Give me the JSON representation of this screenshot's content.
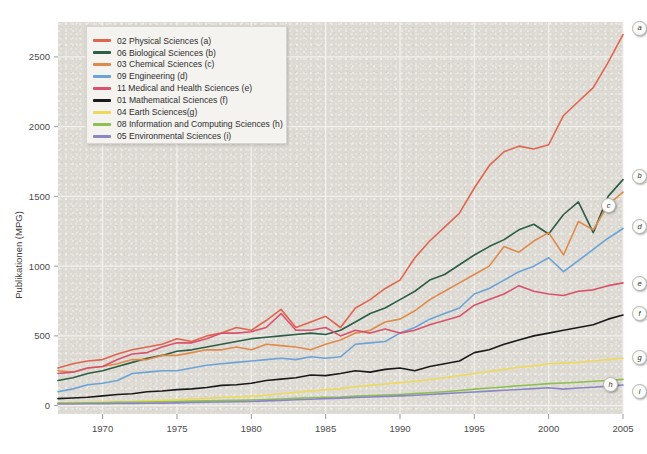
{
  "chart_data": {
    "type": "line",
    "title": "",
    "xlabel": "",
    "ylabel": "Publikationen (MPG)",
    "xlim": [
      1967,
      2005
    ],
    "ylim": [
      -60,
      2750
    ],
    "grid": true,
    "legend_position": "top-left",
    "xticks": [
      "1970",
      "1975",
      "1980",
      "1985",
      "1990",
      "1995",
      "2000",
      "2005"
    ],
    "xtick_values": [
      1970,
      1975,
      1980,
      1985,
      1990,
      1995,
      2000,
      2005
    ],
    "yticks": [
      "0",
      "500",
      "1000",
      "1500",
      "2000",
      "2500"
    ],
    "ytick_values": [
      0,
      500,
      1000,
      1500,
      2000,
      2500
    ],
    "x": [
      1967,
      1968,
      1969,
      1970,
      1971,
      1972,
      1973,
      1974,
      1975,
      1976,
      1977,
      1978,
      1979,
      1980,
      1981,
      1982,
      1983,
      1984,
      1985,
      1986,
      1987,
      1988,
      1989,
      1990,
      1991,
      1992,
      1993,
      1994,
      1995,
      1996,
      1997,
      1998,
      1999,
      2000,
      2001,
      2002,
      2003,
      2004,
      2005
    ],
    "series": [
      {
        "name": "02 Physical Sciences (a)",
        "code": "02",
        "endpoint_label": "a",
        "color": "#e0654f",
        "values": [
          270,
          300,
          320,
          330,
          370,
          400,
          420,
          440,
          480,
          460,
          500,
          520,
          560,
          540,
          610,
          690,
          560,
          600,
          640,
          560,
          700,
          760,
          840,
          900,
          1060,
          1180,
          1280,
          1380,
          1560,
          1720,
          1820,
          1860,
          1840,
          1870,
          2080,
          2180,
          2280,
          2460,
          2660
        ]
      },
      {
        "name": "06 Biological Sciences (b)",
        "code": "06",
        "endpoint_label": "b",
        "color": "#2c5d45",
        "values": [
          180,
          200,
          230,
          250,
          280,
          310,
          340,
          360,
          390,
          400,
          420,
          440,
          460,
          480,
          490,
          500,
          510,
          520,
          510,
          540,
          600,
          660,
          700,
          760,
          820,
          900,
          940,
          1010,
          1080,
          1140,
          1190,
          1260,
          1300,
          1230,
          1370,
          1460,
          1240,
          1500,
          1620
        ]
      },
      {
        "name": "03 Chemical Sciences (c)",
        "code": "03",
        "endpoint_label": "c",
        "color": "#e08a4a",
        "values": [
          250,
          240,
          270,
          280,
          300,
          330,
          330,
          360,
          360,
          380,
          400,
          400,
          420,
          400,
          440,
          430,
          420,
          400,
          440,
          470,
          520,
          540,
          600,
          620,
          680,
          760,
          820,
          880,
          940,
          1000,
          1140,
          1100,
          1180,
          1240,
          1080,
          1320,
          1260,
          1440,
          1530
        ]
      },
      {
        "name": "09 Engineering (d)",
        "code": "09",
        "endpoint_label": "d",
        "color": "#6ba3d6",
        "values": [
          100,
          120,
          150,
          160,
          180,
          230,
          240,
          250,
          250,
          270,
          290,
          300,
          310,
          320,
          330,
          340,
          330,
          350,
          340,
          350,
          440,
          450,
          460,
          520,
          560,
          620,
          660,
          700,
          800,
          840,
          900,
          960,
          1000,
          1060,
          960,
          1040,
          1120,
          1200,
          1270
        ]
      },
      {
        "name": "11 Medical and Health Sciences (e)",
        "code": "11",
        "endpoint_label": "e",
        "color": "#d9516b",
        "values": [
          230,
          240,
          270,
          280,
          330,
          370,
          380,
          420,
          450,
          450,
          480,
          520,
          520,
          530,
          560,
          660,
          540,
          540,
          560,
          500,
          540,
          520,
          550,
          520,
          540,
          580,
          610,
          640,
          720,
          760,
          800,
          860,
          820,
          800,
          790,
          820,
          830,
          860,
          880
        ]
      },
      {
        "name": "01 Mathematical Sciences (f)",
        "code": "01",
        "endpoint_label": "f",
        "color": "#1a1a1a",
        "values": [
          50,
          55,
          60,
          70,
          80,
          85,
          100,
          105,
          115,
          120,
          130,
          145,
          150,
          160,
          180,
          190,
          200,
          220,
          215,
          230,
          250,
          240,
          260,
          270,
          250,
          280,
          300,
          320,
          380,
          400,
          440,
          470,
          500,
          520,
          540,
          560,
          580,
          620,
          650
        ]
      },
      {
        "name": "04 Earth Sciences(g)",
        "code": "04",
        "endpoint_label": "g",
        "color": "#edd95c",
        "values": [
          20,
          22,
          24,
          26,
          28,
          30,
          35,
          38,
          42,
          48,
          52,
          58,
          62,
          68,
          75,
          85,
          95,
          105,
          115,
          120,
          135,
          145,
          155,
          165,
          175,
          185,
          200,
          215,
          230,
          245,
          260,
          275,
          285,
          300,
          305,
          310,
          320,
          330,
          340
        ]
      },
      {
        "name": "08 Information and Computing Sciences (h)",
        "code": "08",
        "endpoint_label": "h",
        "color": "#8fbf4e",
        "values": [
          18,
          19,
          20,
          21,
          23,
          24,
          26,
          28,
          30,
          32,
          34,
          36,
          38,
          40,
          44,
          48,
          52,
          56,
          60,
          62,
          68,
          72,
          76,
          80,
          86,
          92,
          100,
          108,
          118,
          126,
          134,
          142,
          150,
          158,
          162,
          168,
          175,
          180,
          188
        ]
      },
      {
        "name": "05 Environmental Sciences (i)",
        "code": "05",
        "endpoint_label": "i",
        "color": "#8a86c4",
        "values": [
          12,
          12,
          13,
          14,
          15,
          16,
          17,
          18,
          20,
          22,
          24,
          26,
          28,
          30,
          34,
          38,
          42,
          46,
          50,
          54,
          58,
          62,
          66,
          70,
          74,
          80,
          86,
          92,
          98,
          104,
          110,
          116,
          122,
          128,
          118,
          126,
          132,
          140,
          148
        ]
      }
    ]
  },
  "legend": {
    "items": [
      {
        "label": "02 Physical Sciences (a)",
        "color": "#e0654f"
      },
      {
        "label": "06 Biological Sciences (b)",
        "color": "#2c5d45"
      },
      {
        "label": "03 Chemical Sciences (c)",
        "color": "#e08a4a"
      },
      {
        "label": "09 Engineering (d)",
        "color": "#6ba3d6"
      },
      {
        "label": "11 Medical and Health Sciences (e)",
        "color": "#d9516b"
      },
      {
        "label": "01 Mathematical Sciences (f)",
        "color": "#1a1a1a"
      },
      {
        "label": "04 Earth Sciences(g)",
        "color": "#edd95c"
      },
      {
        "label": "08 Information and Computing Sciences (h)",
        "color": "#8fbf4e"
      },
      {
        "label": "05 Environmental Sciences (i)",
        "color": "#8a86c4"
      }
    ]
  },
  "colors": {
    "plot_background": "#dddad4",
    "page_background": "#ffffff",
    "gridline": "#f2f1ee",
    "tick_text": "#4a4a4a",
    "legend_background": "#f4f3f0"
  }
}
